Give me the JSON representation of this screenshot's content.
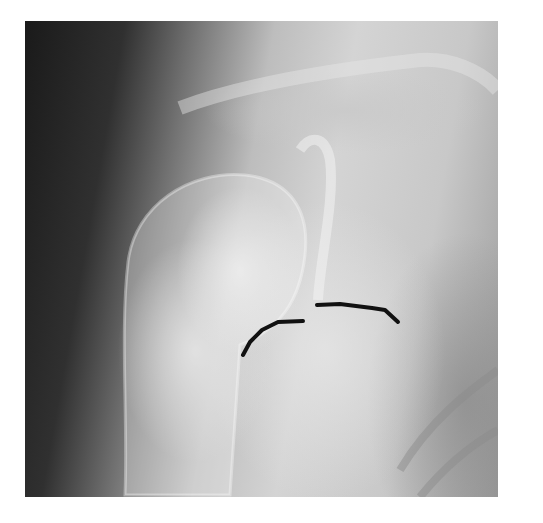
{
  "image": {
    "subject": "Shoulder radiograph (X-ray) with two hand-drawn black line markings",
    "colors": {
      "background": "#ffffff",
      "marking": "#111111"
    },
    "markings": [
      {
        "name": "left-curve",
        "points": [
          [
            243,
            355
          ],
          [
            250,
            342
          ],
          [
            262,
            330
          ],
          [
            278,
            322
          ],
          [
            303,
            321
          ]
        ]
      },
      {
        "name": "right-curve",
        "points": [
          [
            317,
            305
          ],
          [
            340,
            304
          ],
          [
            372,
            308
          ],
          [
            385,
            310
          ],
          [
            398,
            322
          ]
        ]
      }
    ]
  }
}
